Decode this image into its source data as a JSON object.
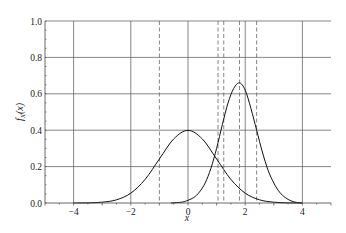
{
  "chart_data": {
    "type": "line",
    "title": "",
    "xlabel": "x",
    "ylabel": "f_X(x)",
    "xlim": [
      -5,
      5
    ],
    "ylim": [
      0,
      1.0
    ],
    "grid": true,
    "legend": null,
    "x_ticks": [
      -4,
      -2,
      0,
      2,
      4
    ],
    "x_tick_labels": [
      "−4",
      "−2",
      "0",
      "2",
      "4"
    ],
    "y_ticks": [
      0.0,
      0.2,
      0.4,
      0.6,
      0.8,
      1.0
    ],
    "y_tick_labels": [
      "0.0",
      "0.2",
      "0.4",
      "0.6",
      "0.8",
      "1.0"
    ],
    "series": [
      {
        "name": "standard normal density",
        "style": "solid",
        "x": [
          -4.0,
          -3.5,
          -3.0,
          -2.5,
          -2.0,
          -1.5,
          -1.0,
          -0.5,
          0.0,
          0.5,
          1.0,
          1.5,
          2.0,
          2.5,
          3.0,
          3.5,
          4.0
        ],
        "y": [
          0.0001,
          0.0009,
          0.0044,
          0.0175,
          0.054,
          0.1295,
          0.242,
          0.3521,
          0.3989,
          0.3521,
          0.242,
          0.1295,
          0.054,
          0.0175,
          0.0044,
          0.0009,
          0.0001
        ]
      },
      {
        "name": "skewed density",
        "style": "solid",
        "x": [
          -0.6,
          -0.2,
          0.0,
          0.2,
          0.4,
          0.6,
          0.8,
          1.0,
          1.2,
          1.4,
          1.6,
          1.8,
          2.0,
          2.2,
          2.4,
          2.6,
          2.8,
          3.0,
          3.2,
          3.4,
          3.6,
          3.8,
          4.0
        ],
        "y": [
          0.0,
          0.005,
          0.015,
          0.03,
          0.06,
          0.11,
          0.19,
          0.3,
          0.43,
          0.55,
          0.63,
          0.66,
          0.62,
          0.52,
          0.4,
          0.28,
          0.18,
          0.11,
          0.06,
          0.03,
          0.012,
          0.003,
          0.0
        ]
      }
    ],
    "vertical_dashed_lines": [
      -1.0,
      1.05,
      1.25,
      1.8,
      2.4
    ]
  }
}
